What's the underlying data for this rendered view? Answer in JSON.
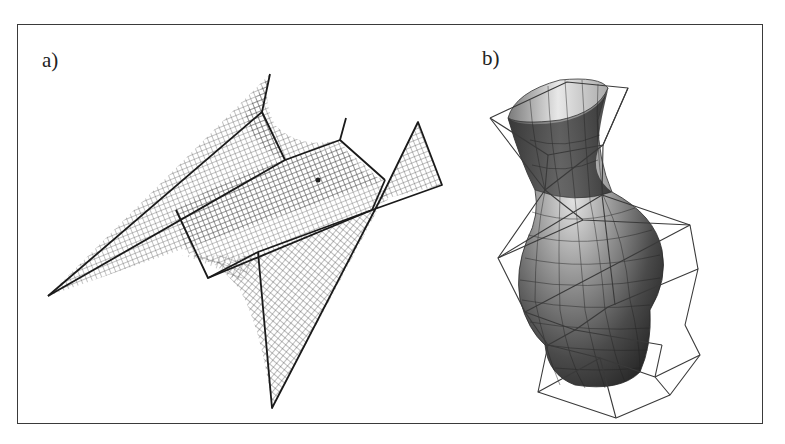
{
  "figure": {
    "panels": [
      {
        "id": "a",
        "label": "a)",
        "description": "Wireframe mesh surface with control polygon (saddle-like surface)"
      },
      {
        "id": "b",
        "label": "b)",
        "description": "Shaded vase-shaped surface with control polygon"
      }
    ],
    "colors": {
      "frame": "#3a3a3a",
      "mesh": "#555555",
      "control_polygon": "#1a1a1a",
      "vase_dark": "#2e2e2e",
      "vase_light": "#d8d8d8"
    }
  }
}
